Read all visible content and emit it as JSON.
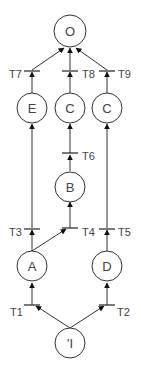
{
  "diagram": {
    "type": "petri-net",
    "colors": {
      "stroke": "#333333",
      "text": "#444444",
      "background": "#ffffff"
    },
    "places": [
      {
        "id": "O",
        "label": "O"
      },
      {
        "id": "E",
        "label": "E"
      },
      {
        "id": "C1",
        "label": "C"
      },
      {
        "id": "C2",
        "label": "C"
      },
      {
        "id": "B",
        "label": "B"
      },
      {
        "id": "A",
        "label": "A"
      },
      {
        "id": "D",
        "label": "D"
      },
      {
        "id": "I",
        "label": "'I"
      }
    ],
    "transitions": [
      {
        "id": "T1",
        "label": "T1"
      },
      {
        "id": "T2",
        "label": "T2"
      },
      {
        "id": "T3",
        "label": "T3"
      },
      {
        "id": "T4",
        "label": "T4"
      },
      {
        "id": "T5",
        "label": "T5"
      },
      {
        "id": "T6",
        "label": "T6"
      },
      {
        "id": "T7",
        "label": "T7"
      },
      {
        "id": "T8",
        "label": "T8"
      },
      {
        "id": "T9",
        "label": "T9"
      }
    ],
    "arcs": [
      [
        "I",
        "T1"
      ],
      [
        "I",
        "T2"
      ],
      [
        "T1",
        "A"
      ],
      [
        "T2",
        "D"
      ],
      [
        "A",
        "T3"
      ],
      [
        "A",
        "T4"
      ],
      [
        "D",
        "T5"
      ],
      [
        "T4",
        "B"
      ],
      [
        "B",
        "T6"
      ],
      [
        "T6",
        "C1"
      ],
      [
        "T3",
        "E"
      ],
      [
        "T5",
        "C2"
      ],
      [
        "E",
        "T7"
      ],
      [
        "C1",
        "T8"
      ],
      [
        "C2",
        "T9"
      ],
      [
        "T7",
        "O"
      ],
      [
        "T8",
        "O"
      ],
      [
        "T9",
        "O"
      ]
    ]
  }
}
